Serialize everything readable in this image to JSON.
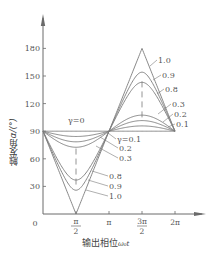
{
  "chart_data": {
    "type": "line",
    "title": "",
    "xlabel": "输出相位 ω0t",
    "ylabel": "触发角α/(°)",
    "xlabel_main": "输出相位",
    "xlabel_symbol": "ω₀t",
    "ylabel_main": "触发角",
    "ylabel_symbol": "α/(°)",
    "x_ticks": [
      {
        "value": 0,
        "label": "0"
      },
      {
        "value": 1.5708,
        "label": "π/2"
      },
      {
        "value": 3.1416,
        "label": "π"
      },
      {
        "value": 4.7124,
        "label": "3π/2"
      },
      {
        "value": 6.2832,
        "label": "2π"
      }
    ],
    "y_ticks": [
      30,
      60,
      90,
      120,
      150,
      180
    ],
    "xlim": [
      0,
      6.8
    ],
    "ylim": [
      0,
      200
    ],
    "grid": false,
    "formula": "alpha = 90 - arcsin(gamma * sin(x)) [deg]",
    "series": [
      {
        "name": "γ=0",
        "gamma": 0.0,
        "min_at_pi_over_2": 90.0,
        "max_at_3pi_over_2": 90.0
      },
      {
        "name": "γ=0.1",
        "gamma": 0.1,
        "min_at_pi_over_2": 84.3,
        "max_at_3pi_over_2": 95.7
      },
      {
        "name": "γ=0.2",
        "gamma": 0.2,
        "min_at_pi_over_2": 78.5,
        "max_at_3pi_over_2": 101.5
      },
      {
        "name": "γ=0.3",
        "gamma": 0.3,
        "min_at_pi_over_2": 72.5,
        "max_at_3pi_over_2": 107.5
      },
      {
        "name": "γ=0.8",
        "gamma": 0.8,
        "min_at_pi_over_2": 36.9,
        "max_at_3pi_over_2": 143.1
      },
      {
        "name": "γ=0.9",
        "gamma": 0.9,
        "min_at_pi_over_2": 25.8,
        "max_at_3pi_over_2": 154.2
      },
      {
        "name": "γ=1.0",
        "gamma": 1.0,
        "min_at_pi_over_2": 0.0,
        "max_at_3pi_over_2": 180.0
      }
    ],
    "annotations": {
      "gamma0_label": "γ=0",
      "lower_labels": [
        "γ=0.1",
        "0.2",
        "0.3",
        "0.8",
        "0.9",
        "1.0"
      ],
      "upper_labels": [
        "1.0",
        "0.9",
        "0.8",
        "0.3",
        "0.2",
        "0.1"
      ]
    }
  },
  "colors": {
    "axis": "#6a6a6a",
    "curve": "#7a7a7a",
    "text": "#555555"
  }
}
